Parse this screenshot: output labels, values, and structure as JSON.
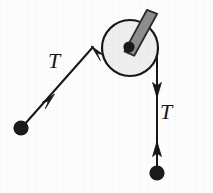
{
  "figure": {
    "background_color": "#fdfdfd",
    "stroke_color": "#171717",
    "labels": {
      "left_tension": "T",
      "right_tension": "T"
    },
    "pulley": {
      "name": "pulley-wheel",
      "center_x": 130,
      "center_y": 48,
      "radius": 28,
      "face_color": "#eeeeee",
      "rim_color": "#171717",
      "rim_width": 2,
      "hub": {
        "name": "pulley-hub",
        "center_x": 129,
        "center_y": 47,
        "radius": 5.5,
        "color": "#1a1a1a"
      },
      "axle_bar": {
        "name": "pulley-axle-bar",
        "fill_color": "#8d8d8d",
        "edge_color": "#2b2b2b",
        "x1": 129,
        "y1": 47,
        "x2": 152,
        "y2": 14,
        "width": 11
      }
    },
    "ropes": [
      {
        "name": "left-rope",
        "x1": 24,
        "y1": 125,
        "x2": 92,
        "y2": 48,
        "stroke_width": 2,
        "arrow_at_end": "up-left",
        "mid_arrow_at": 0.42,
        "mid_arrow_direction": "up-right"
      },
      {
        "name": "right-rope-upper",
        "x1": 157,
        "y1": 58,
        "x2": 157,
        "y2": 96,
        "stroke_width": 2,
        "arrow_at_end": "down"
      },
      {
        "name": "right-rope-lower",
        "x1": 157,
        "y1": 172,
        "x2": 157,
        "y2": 140,
        "stroke_width": 2,
        "arrow_at_end": "up"
      }
    ],
    "masses": [
      {
        "name": "left-mass",
        "cx": 21,
        "cy": 128,
        "r": 7.5,
        "color": "#1a1a1a"
      },
      {
        "name": "right-mass",
        "cx": 157,
        "cy": 173,
        "r": 7.5,
        "color": "#1a1a1a"
      }
    ]
  }
}
